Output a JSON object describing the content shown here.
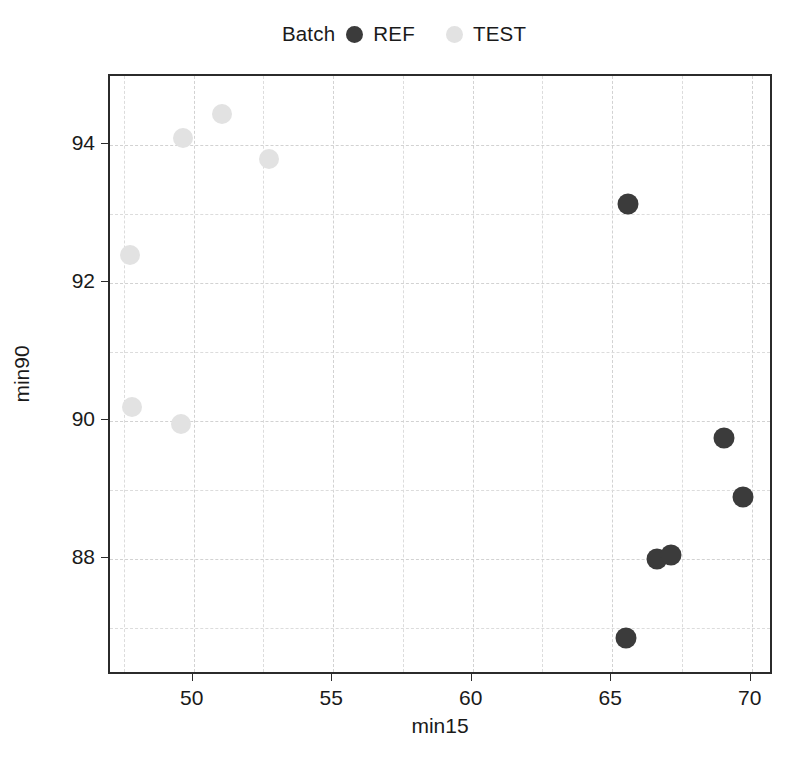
{
  "chart_data": {
    "type": "scatter",
    "title": "",
    "xlabel": "min15",
    "ylabel": "min90",
    "xlim": [
      47.0,
      70.8
    ],
    "ylim": [
      86.3,
      95.0
    ],
    "xticks": [
      50,
      55,
      60,
      65,
      70
    ],
    "yticks": [
      88,
      90,
      92,
      94
    ],
    "xtick_labels": [
      "50",
      "55",
      "60",
      "65",
      "70"
    ],
    "ytick_labels": [
      "88",
      "90",
      "92",
      "94"
    ],
    "grid": true,
    "legend": {
      "title": "Batch",
      "position": "top-center",
      "entries": [
        {
          "label": "REF",
          "color": "#3b3b3b"
        },
        {
          "label": "TEST",
          "color": "#e2e2e2"
        }
      ]
    },
    "series": [
      {
        "name": "REF",
        "color": "#3b3b3b",
        "points": [
          {
            "x": 65.55,
            "y": 93.15
          },
          {
            "x": 65.5,
            "y": 86.85
          },
          {
            "x": 66.6,
            "y": 88.0
          },
          {
            "x": 67.1,
            "y": 88.05
          },
          {
            "x": 69.0,
            "y": 89.75
          },
          {
            "x": 69.7,
            "y": 88.9
          }
        ]
      },
      {
        "name": "TEST",
        "color": "#e2e2e2",
        "points": [
          {
            "x": 47.7,
            "y": 92.4
          },
          {
            "x": 47.8,
            "y": 90.2
          },
          {
            "x": 49.55,
            "y": 89.95
          },
          {
            "x": 49.6,
            "y": 94.1
          },
          {
            "x": 51.0,
            "y": 94.45
          },
          {
            "x": 52.7,
            "y": 93.8
          }
        ]
      }
    ],
    "gridlines_x_major": [
      50,
      55,
      60,
      65,
      70
    ],
    "gridlines_x_minor": [
      47.5,
      52.5,
      57.5,
      62.5,
      67.5
    ],
    "gridlines_y_major": [
      88,
      90,
      92,
      94
    ],
    "gridlines_y_minor": [
      87,
      89,
      91,
      93
    ]
  }
}
